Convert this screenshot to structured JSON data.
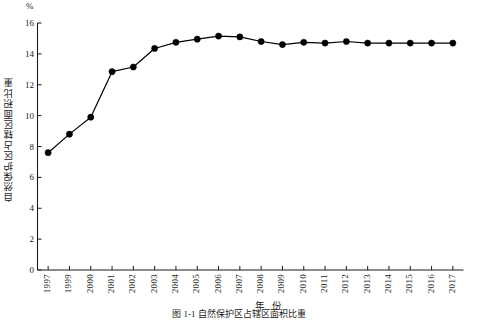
{
  "figure": {
    "unit_label": "%",
    "y_axis_title": "自然保护区占辖区面积比重",
    "x_axis_title": "年  份",
    "caption": "图 1-1  自然保护区占辖区面积比重"
  },
  "chart_data": {
    "type": "line",
    "title": "图 1-1  自然保护区占辖区面积比重",
    "xlabel": "年  份",
    "ylabel": "自然保护区占辖区面积比重",
    "unit": "%",
    "categories": [
      "1997",
      "1999",
      "2000",
      "2001",
      "2002",
      "2003",
      "2004",
      "2005",
      "2006",
      "2007",
      "2008",
      "2009",
      "2010",
      "2011",
      "2012",
      "2013",
      "2014",
      "2015",
      "2016",
      "2017"
    ],
    "values": [
      7.6,
      8.8,
      9.9,
      12.85,
      13.15,
      14.35,
      14.75,
      14.95,
      15.15,
      15.1,
      14.8,
      14.6,
      14.75,
      14.7,
      14.8,
      14.7,
      14.7,
      14.7,
      14.7,
      14.7
    ],
    "ylim": [
      0,
      16
    ],
    "yticks": [
      0,
      2,
      4,
      6,
      8,
      10,
      12,
      14,
      16
    ],
    "ytick_labels": [
      "0",
      "2",
      "4",
      "6",
      "8",
      "10",
      "12",
      "14",
      "16"
    ],
    "grid": false,
    "legend": "none",
    "marker": "filled-circle",
    "marker_color": "#000000",
    "line_color": "#000000"
  }
}
